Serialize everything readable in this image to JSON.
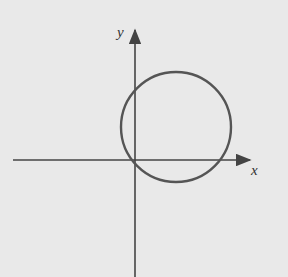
{
  "diagram": {
    "axes": {
      "x_label": "x",
      "y_label": "y"
    },
    "circle": {
      "cx": 176,
      "cy": 127,
      "r": 55
    },
    "colors": {
      "background": "#e9e9e9",
      "axis": "#444444",
      "circle": "#555555"
    }
  }
}
